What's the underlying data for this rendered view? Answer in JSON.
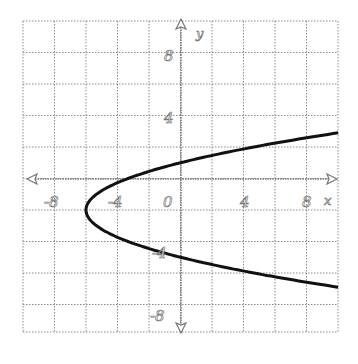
{
  "chart_data": {
    "type": "line",
    "title": "",
    "xlabel": "x",
    "ylabel": "y",
    "xlim": [
      -10,
      10
    ],
    "ylim": [
      -10,
      10
    ],
    "grid": true,
    "grid_step": 2,
    "x_ticks": [
      "-8",
      "-4",
      "0",
      "4",
      "8"
    ],
    "y_ticks": [
      "8",
      "4",
      "-4",
      "-8"
    ],
    "series": [
      {
        "name": "parabola x = (2/3)(y+2)^2 - 6",
        "vertex": [
          -6,
          -2
        ],
        "opens": "right",
        "points": [
          [
            10,
            2.9
          ],
          [
            6,
            2.24
          ],
          [
            4,
            1.87
          ],
          [
            2,
            1.46
          ],
          [
            0,
            1
          ],
          [
            -2,
            0.45
          ],
          [
            -4,
            -0.27
          ],
          [
            -5,
            -0.78
          ],
          [
            -6,
            -2
          ],
          [
            -5,
            -3.22
          ],
          [
            -4,
            -3.73
          ],
          [
            -2,
            -4.45
          ],
          [
            0,
            -5
          ],
          [
            2,
            -5.46
          ],
          [
            4,
            -5.87
          ],
          [
            6,
            -6.24
          ],
          [
            10,
            -6.9
          ]
        ]
      }
    ]
  },
  "labels": {
    "x_axis": "x",
    "y_axis": "y",
    "tick_neg8_x": "-8",
    "tick_neg4_x": "-4",
    "tick_0": "0",
    "tick_4_x": "4",
    "tick_8_x": "8",
    "tick_8_y": "8",
    "tick_4_y": "4",
    "tick_neg4_y": "-4",
    "tick_neg8_y": "-8"
  },
  "colors": {
    "curve": "#111111",
    "grid": "#8a8a8a"
  }
}
